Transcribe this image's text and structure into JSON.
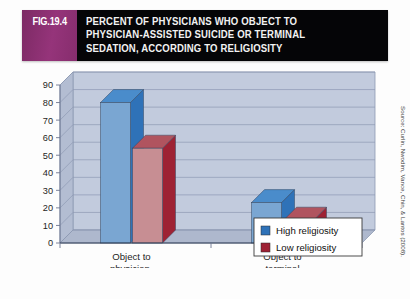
{
  "figure": {
    "badge": "FIG.19.4",
    "title_lines": [
      "PERCENT OF PHYSICIANS WHO OBJECT TO",
      "PHYSICIAN-ASSISTED SUICIDE OR TERMINAL",
      "SEDATION, ACCORDING TO RELIGIOSITY"
    ],
    "badge_color": "#8e2f71",
    "title_bar_color": "#050507",
    "source": "Source: Curlin, Nwodim, Vance, Chin, & Lantos (2008)."
  },
  "legend": {
    "items": [
      {
        "label": "High religiosity",
        "color": "#2f72b8"
      },
      {
        "label": "Low religiosity",
        "color": "#9e2234"
      }
    ]
  },
  "chart_data": {
    "type": "bar",
    "title": "PERCENT OF PHYSICIANS WHO OBJECT TO PHYSICIAN-ASSISTED SUICIDE OR TERMINAL SEDATION, ACCORDING TO RELIGIOSITY",
    "xlabel": "",
    "ylabel": "",
    "ylim": [
      0,
      90
    ],
    "yticks": [
      0,
      10,
      20,
      30,
      40,
      50,
      60,
      70,
      80,
      90
    ],
    "ytick_labels": [
      "0",
      "10",
      "20",
      "30",
      "40",
      "50",
      "60",
      "70",
      "80",
      "90"
    ],
    "grid": true,
    "legend_position": "bottom-right",
    "style": "3d-grouped-column",
    "categories": [
      "Object to physician-assisted suicide",
      "Object to terminal sedation"
    ],
    "category_label_lines": [
      [
        "Object to",
        "physician-",
        "assisted suicide"
      ],
      [
        "Object to",
        "terminal",
        "sedation"
      ]
    ],
    "series": [
      {
        "name": "High religiosity",
        "color": "#7aa6d2",
        "top_color": "#4a8ccb",
        "side_color": "#2f72b8",
        "values": [
          80,
          23
        ]
      },
      {
        "name": "Low religiosity",
        "color": "#c78e93",
        "top_color": "#b0545f",
        "side_color": "#9e2234",
        "values": [
          54,
          13
        ]
      }
    ]
  }
}
